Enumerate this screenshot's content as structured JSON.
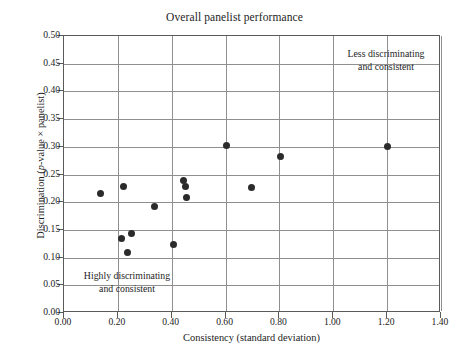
{
  "chart_data": {
    "type": "scatter",
    "title": "Overall panelist performance",
    "xlabel_plain": "Consistency (standard deviation)",
    "xlabel_prefix": "Consistency (standard deviation)",
    "ylabel_pre": "Discrimination (",
    "ylabel_italic": "p",
    "ylabel_post": "-value × panelist)",
    "ylabel_plain": "Discrimination (p-value × panelist)",
    "xlim": [
      0.0,
      1.4
    ],
    "ylim": [
      0.0,
      0.5
    ],
    "xticks": [
      "0.00",
      "0.20",
      "0.40",
      "0.60",
      "0.80",
      "1.00",
      "1.20",
      "1.40"
    ],
    "xtick_values": [
      0.0,
      0.2,
      0.4,
      0.6,
      0.8,
      1.0,
      1.2,
      1.4
    ],
    "yticks": [
      "0.00",
      "0.05",
      "0.10",
      "0.15",
      "0.20",
      "0.25",
      "0.30",
      "0.35",
      "0.40",
      "0.45",
      "0.50"
    ],
    "ytick_values": [
      0.0,
      0.05,
      0.1,
      0.15,
      0.2,
      0.25,
      0.3,
      0.35,
      0.4,
      0.45,
      0.5
    ],
    "grid": true,
    "grid_color": "#8f8f8f",
    "marker_color": "#2b2b2b",
    "legend": null,
    "points": [
      {
        "x": 0.135,
        "y": 0.215
      },
      {
        "x": 0.22,
        "y": 0.228
      },
      {
        "x": 0.215,
        "y": 0.134
      },
      {
        "x": 0.25,
        "y": 0.143
      },
      {
        "x": 0.235,
        "y": 0.11
      },
      {
        "x": 0.335,
        "y": 0.193
      },
      {
        "x": 0.405,
        "y": 0.123
      },
      {
        "x": 0.445,
        "y": 0.24
      },
      {
        "x": 0.45,
        "y": 0.228
      },
      {
        "x": 0.455,
        "y": 0.208
      },
      {
        "x": 0.605,
        "y": 0.303
      },
      {
        "x": 0.695,
        "y": 0.227
      },
      {
        "x": 0.805,
        "y": 0.283
      },
      {
        "x": 1.2,
        "y": 0.3
      }
    ],
    "annotations": [
      {
        "name": "less-discriminating",
        "line1": "Less discriminating",
        "line2": "and consistent",
        "x": 1.15,
        "y": 0.445
      },
      {
        "name": "highly-discriminating",
        "line1": "Highly discriminating",
        "line2": "and consistent",
        "x": 0.27,
        "y": 0.065
      }
    ]
  }
}
